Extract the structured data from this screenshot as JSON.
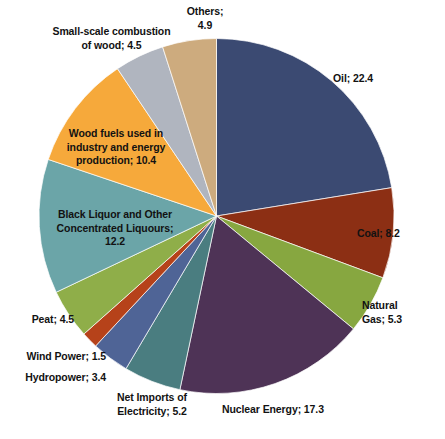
{
  "chart_data": {
    "type": "pie",
    "title": "",
    "subtitle": "",
    "xlabel": "",
    "ylabel": "",
    "legend_position": "none",
    "grid": false,
    "label_format": "name; value",
    "start_angle_deg": 0,
    "direction": "clockwise",
    "total": 100.4,
    "categories": [
      "Oil",
      "Coal",
      "Natural Gas",
      "Nuclear Energy",
      "Net Imports of Electricity",
      "Hydropower",
      "Wind Power",
      "Peat",
      "Black Liquor and Other Concentrated Liquours",
      "Wood fuels used in industry and energy production",
      "Small-scale combustion of wood",
      "Others"
    ],
    "values": [
      22.4,
      8.2,
      5.3,
      17.3,
      5.2,
      3.4,
      1.5,
      4.5,
      12.2,
      10.4,
      4.5,
      4.9
    ],
    "colors": [
      "#3b4a72",
      "#8c2f14",
      "#87a740",
      "#4e3356",
      "#4a7d80",
      "#4f6496",
      "#b6421a",
      "#8fae49",
      "#6ba5a8",
      "#f6a93b",
      "#b0b5bf",
      "#cdab7e"
    ],
    "slices": [
      {
        "name": "Oil",
        "value": 22.4,
        "color": "#3b4a72",
        "label": "Oil; 22.4",
        "label_placement": "outside-right"
      },
      {
        "name": "Coal",
        "value": 8.2,
        "color": "#8c2f14",
        "label": "Coal; 8.2",
        "label_placement": "outside-right"
      },
      {
        "name": "Natural Gas",
        "value": 5.3,
        "color": "#87a740",
        "label": "Natural\nGas; 5.3",
        "label_placement": "outside-right"
      },
      {
        "name": "Nuclear Energy",
        "value": 17.3,
        "color": "#4e3356",
        "label": "Nuclear Energy; 17.3",
        "label_placement": "outside-bottom"
      },
      {
        "name": "Net Imports of Electricity",
        "value": 5.2,
        "color": "#4a7d80",
        "label": "Net Imports of\nElectricity; 5.2",
        "label_placement": "outside-bottom"
      },
      {
        "name": "Hydropower",
        "value": 3.4,
        "color": "#4f6496",
        "label": "Hydropower; 3.4",
        "label_placement": "outside-left"
      },
      {
        "name": "Wind Power",
        "value": 1.5,
        "color": "#b6421a",
        "label": "Wind Power; 1.5",
        "label_placement": "outside-left"
      },
      {
        "name": "Peat",
        "value": 4.5,
        "color": "#8fae49",
        "label": "Peat; 4.5",
        "label_placement": "outside-left"
      },
      {
        "name": "Black Liquor and Other Concentrated Liquours",
        "value": 12.2,
        "color": "#6ba5a8",
        "label": "Black Liquor and Other\nConcentrated Liquours;\n12.2",
        "label_placement": "inside"
      },
      {
        "name": "Wood fuels used in industry and energy production",
        "value": 10.4,
        "color": "#f6a93b",
        "label": "Wood fuels used in\nindustry and energy\nproduction; 10.4",
        "label_placement": "inside"
      },
      {
        "name": "Small-scale combustion of wood",
        "value": 4.5,
        "color": "#b0b5bf",
        "label": "Small-scale combustion\nof wood; 4.5",
        "label_placement": "outside-top"
      },
      {
        "name": "Others",
        "value": 4.9,
        "color": "#cdab7e",
        "label": "Others;\n4.9",
        "label_placement": "outside-top"
      }
    ]
  }
}
